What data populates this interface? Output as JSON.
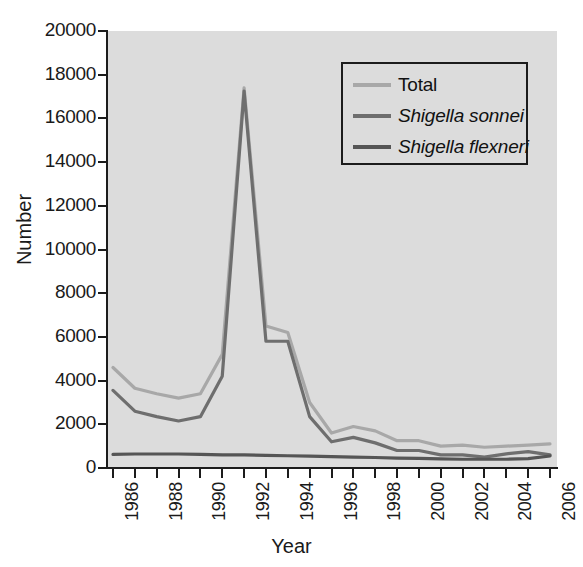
{
  "chart_data": {
    "type": "line",
    "title": "",
    "xlabel": "Year",
    "ylabel": "Number",
    "xlim": [
      1986,
      2006
    ],
    "ylim": [
      0,
      20000
    ],
    "grid": false,
    "legend_position": "top-right",
    "x": [
      1986,
      1987,
      1988,
      1989,
      1990,
      1991,
      1992,
      1993,
      1994,
      1995,
      1996,
      1997,
      1998,
      1999,
      2000,
      2001,
      2002,
      2003,
      2004,
      2005,
      2006
    ],
    "xtick_labels": [
      "1986",
      "1988",
      "1990",
      "1992",
      "1994",
      "1996",
      "1998",
      "2000",
      "2002",
      "2004",
      "2006"
    ],
    "xtick_values": [
      1986,
      1988,
      1990,
      1992,
      1994,
      1996,
      1998,
      2000,
      2002,
      2004,
      2006
    ],
    "ytick_labels": [
      "0",
      "2000",
      "4000",
      "6000",
      "8000",
      "10000",
      "12000",
      "14000",
      "16000",
      "18000",
      "20000"
    ],
    "ytick_values": [
      0,
      2000,
      4000,
      6000,
      8000,
      10000,
      12000,
      14000,
      16000,
      18000,
      20000
    ],
    "series": [
      {
        "name": "Total",
        "color": "#a8a8a8",
        "italic": false,
        "values": [
          4600,
          3650,
          3400,
          3200,
          3400,
          5200,
          17400,
          6500,
          6200,
          3000,
          1600,
          1900,
          1700,
          1250,
          1250,
          1000,
          1050,
          950,
          1000,
          1050,
          1100
        ]
      },
      {
        "name": "Shigella sonnei",
        "color": "#6e6e6e",
        "italic": true,
        "values": [
          3550,
          2600,
          2350,
          2150,
          2350,
          4200,
          17250,
          5800,
          5800,
          2350,
          1200,
          1400,
          1150,
          800,
          800,
          600,
          600,
          500,
          650,
          750,
          600
        ]
      },
      {
        "name": "Shigella flexneri",
        "color": "#555555",
        "italic": true,
        "values": [
          620,
          640,
          640,
          640,
          620,
          600,
          600,
          580,
          560,
          540,
          520,
          500,
          480,
          450,
          440,
          420,
          400,
          400,
          400,
          430,
          550
        ]
      }
    ]
  },
  "axis": {
    "y_title": "Number",
    "x_title": "Year"
  },
  "legend": {
    "items": [
      {
        "label": "Total"
      },
      {
        "label": "Shigella sonnei"
      },
      {
        "label": "Shigella flexneri"
      }
    ]
  },
  "colors": {
    "plot_background": "#dcdcdc",
    "figure_background": "#ffffff",
    "axis": "#1c1c1c",
    "text": "#1a1a1a"
  }
}
